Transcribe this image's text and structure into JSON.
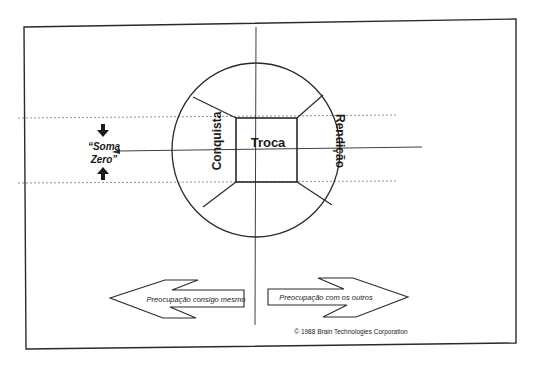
{
  "diagram": {
    "center_label": "Troca",
    "left_label": "Conquista",
    "right_label": "Rendição",
    "zero_sum_label_line1": "“Soma",
    "zero_sum_label_line2": "Zero”",
    "left_arrow_label": "Preocupação consigo mesmo",
    "right_arrow_label": "Preocupação com os outros",
    "copyright": "© 1988 Brain Technologies Corporation",
    "icons": {
      "down_arrow": "arrow-down-icon",
      "up_arrow": "arrow-up-icon"
    },
    "colors": {
      "line": "#2a2a2a",
      "background": "#ffffff"
    }
  }
}
